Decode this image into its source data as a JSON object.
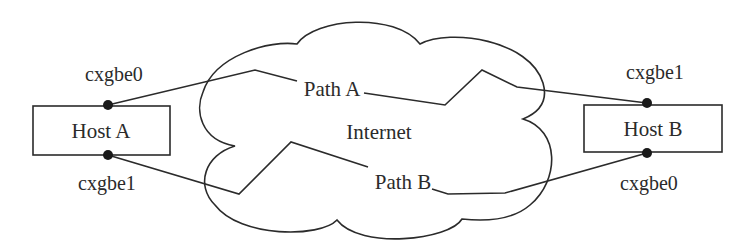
{
  "diagram": {
    "type": "network-multipath",
    "cloud": {
      "label": "Internet"
    },
    "hosts": [
      {
        "id": "host-a",
        "label": "Host A",
        "interfaces": [
          {
            "name": "cxgbe0",
            "position": "top"
          },
          {
            "name": "cxgbe1",
            "position": "bottom"
          }
        ]
      },
      {
        "id": "host-b",
        "label": "Host B",
        "interfaces": [
          {
            "name": "cxgbe1",
            "position": "top"
          },
          {
            "name": "cxgbe0",
            "position": "bottom"
          }
        ]
      }
    ],
    "paths": [
      {
        "label": "Path A",
        "from": "Host A cxgbe0",
        "to": "Host B cxgbe1"
      },
      {
        "label": "Path B",
        "from": "Host A cxgbe1",
        "to": "Host B cxgbe0"
      }
    ],
    "colors": {
      "line": "#2b2b2b",
      "dot": "#1a1a1a",
      "background": "#ffffff"
    }
  }
}
